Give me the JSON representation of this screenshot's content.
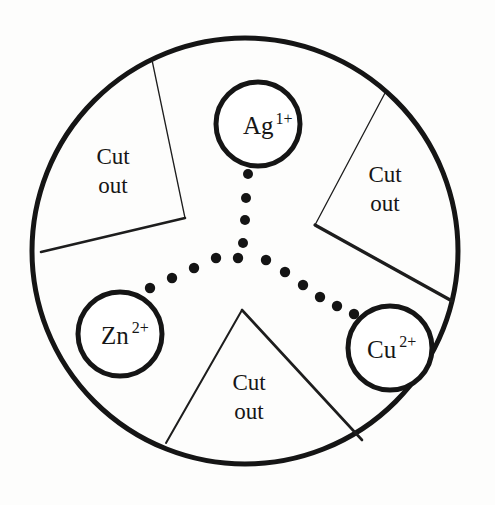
{
  "figure": {
    "background_color": "#fdfdfc",
    "outer_circle": {
      "name": "outer-disc",
      "cx": 245,
      "cy": 251,
      "r": 213,
      "stroke_color": "#151515",
      "stroke_width": 5
    },
    "ions": [
      {
        "id": "ag",
        "symbol": "Ag",
        "charge": "1+",
        "label": "Ag 1+",
        "cx": 258,
        "cy": 124,
        "r": 42,
        "text_x": 243,
        "text_y": 134,
        "sup_dx": 2,
        "sup_dy": -10,
        "stroke_color": "#151515",
        "stroke_width": 5
      },
      {
        "id": "zn",
        "symbol": "Zn",
        "charge": "2+",
        "label": "Zn 2+",
        "cx": 120,
        "cy": 334,
        "r": 42,
        "text_x": 101,
        "text_y": 344,
        "sup_dx": 3,
        "sup_dy": -11,
        "stroke_color": "#151515",
        "stroke_width": 5
      },
      {
        "id": "cu",
        "symbol": "Cu",
        "charge": "2+",
        "label": "Cu 2+",
        "cx": 390,
        "cy": 348,
        "r": 42,
        "text_x": 367,
        "text_y": 358,
        "sup_dx": 3,
        "sup_dy": -11,
        "stroke_color": "#151515",
        "stroke_width": 5
      }
    ],
    "cutouts": [
      {
        "id": "cutout-top-left",
        "line1": "Cut",
        "line2": "out",
        "text_x": 113,
        "text_y1": 164,
        "text_y2": 193,
        "points": "152,60 185,218 41,252",
        "stroke_color": "#1d1d1d",
        "stroke_width_thin": 1.3,
        "stroke_width_thick": 2.6
      },
      {
        "id": "cutout-right",
        "line1": "Cut",
        "line2": "out",
        "text_x": 385,
        "text_y1": 182,
        "text_y2": 211,
        "points": "385,93 315,225 452,301",
        "stroke_color": "#1d1d1d",
        "stroke_width_thin": 1.3,
        "stroke_width_thick": 3.2
      },
      {
        "id": "cutout-bottom",
        "line1": "Cut",
        "line2": "out",
        "text_x": 249,
        "text_y1": 390,
        "text_y2": 419,
        "points": "166,443 242,310 362,440",
        "stroke_color": "#1d1d1d",
        "stroke_width_thin": 2.0,
        "stroke_width_thick": 2.6
      }
    ],
    "dot_arms": [
      {
        "id": "dot-arm-top",
        "toward": "Ag",
        "dots": [
          {
            "cx": 248,
            "cy": 174,
            "r": 5.0
          },
          {
            "cx": 246,
            "cy": 198,
            "r": 5.0
          },
          {
            "cx": 245,
            "cy": 220,
            "r": 5.0
          },
          {
            "cx": 243,
            "cy": 243,
            "r": 5.0
          },
          {
            "cx": 238,
            "cy": 258,
            "r": 5.2
          }
        ]
      },
      {
        "id": "dot-arm-left",
        "toward": "Zn",
        "dots": [
          {
            "cx": 216,
            "cy": 258,
            "r": 5.2
          },
          {
            "cx": 214,
            "cy": 259,
            "r": 0.1
          },
          {
            "cx": 213,
            "cy": 259,
            "r": 0.1
          },
          {
            "cx": 212,
            "cy": 259,
            "r": 0.1
          },
          {
            "cx": 212,
            "cy": 259,
            "r": 0.1
          },
          {
            "cx": 213,
            "cy": 260,
            "r": 0.1
          },
          {
            "cx": 214,
            "cy": 260,
            "r": 0.1
          },
          {
            "cx": 215,
            "cy": 261,
            "r": 0.1
          },
          {
            "cx": 213,
            "cy": 258,
            "r": 0.1
          },
          {
            "cx": 214,
            "cy": 259,
            "r": 0.1
          },
          {
            "cx": 213,
            "cy": 260,
            "r": 0.1
          },
          {
            "cx": 214,
            "cy": 259,
            "r": 0.1
          },
          {
            "cx": 212,
            "cy": 260,
            "r": 0.1
          },
          {
            "cx": 215,
            "cy": 259,
            "r": 0.1
          },
          {
            "cx": 213,
            "cy": 259,
            "r": 0.1
          },
          {
            "cx": 213,
            "cy": 260,
            "r": 0.1
          },
          {
            "cx": 214,
            "cy": 260,
            "r": 0.1
          },
          {
            "cx": 213,
            "cy": 259,
            "r": 0.1
          },
          {
            "cx": 214,
            "cy": 259,
            "r": 0.1
          },
          {
            "cx": 213,
            "cy": 259,
            "r": 0.1
          },
          {
            "cx": 214,
            "cy": 260,
            "r": 0.1
          },
          {
            "cx": 213,
            "cy": 259,
            "r": 0.1
          },
          {
            "cx": 212,
            "cy": 260,
            "r": 0.1
          },
          {
            "cx": 213,
            "cy": 259,
            "r": 0.1
          },
          {
            "cx": 214,
            "cy": 259,
            "r": 0.1
          },
          {
            "cx": 213,
            "cy": 260,
            "r": 0.1
          },
          {
            "cx": 214,
            "cy": 259,
            "r": 0.1
          },
          {
            "cx": 213,
            "cy": 259,
            "r": 0.1
          },
          {
            "cx": 195,
            "cy": 258,
            "r": 0.1
          },
          {
            "cx": 214,
            "cy": 260,
            "r": 0.1
          },
          {
            "cx": 213,
            "cy": 259,
            "r": 0.1
          },
          {
            "cx": 214,
            "cy": 259,
            "r": 0.1
          },
          {
            "cx": 213,
            "cy": 260,
            "r": 0.1
          },
          {
            "cx": 214,
            "cy": 259,
            "r": 0.1
          },
          {
            "cx": 213,
            "cy": 259,
            "r": 0.1
          },
          {
            "cx": 213,
            "cy": 260,
            "r": 0.1
          },
          {
            "cx": 214,
            "cy": 259,
            "r": 0.1
          },
          {
            "cx": 213,
            "cy": 259,
            "r": 0.1
          },
          {
            "cx": 214,
            "cy": 260,
            "r": 0.1
          },
          {
            "cx": 213,
            "cy": 259,
            "r": 0.1
          },
          {
            "cx": 214,
            "cy": 259,
            "r": 0.1
          },
          {
            "cx": 213,
            "cy": 260,
            "r": 0.1
          },
          {
            "cx": 212,
            "cy": 259,
            "r": 0.1
          },
          {
            "cx": 213,
            "cy": 259,
            "r": 0.1
          },
          {
            "cx": 214,
            "cy": 260,
            "r": 0.1
          },
          {
            "cx": 213,
            "cy": 259,
            "r": 0.1
          },
          {
            "cx": 214,
            "cy": 259,
            "r": 0.1
          },
          {
            "cx": 213,
            "cy": 259,
            "r": 0.1
          },
          {
            "cx": 214,
            "cy": 260,
            "r": 0.1
          },
          {
            "cx": 213,
            "cy": 259,
            "r": 0.1
          },
          {
            "cx": 213,
            "cy": 259,
            "r": 0.1
          },
          {
            "cx": 214,
            "cy": 259,
            "r": 0.1
          },
          {
            "cx": 213,
            "cy": 260,
            "r": 0.1
          },
          {
            "cx": 214,
            "cy": 259,
            "r": 0.1
          },
          {
            "cx": 213,
            "cy": 259,
            "r": 0.1
          },
          {
            "cx": 214,
            "cy": 259,
            "r": 0.1
          },
          {
            "cx": 213,
            "cy": 260,
            "r": 0.1
          },
          {
            "cx": 214,
            "cy": 259,
            "r": 0.1
          },
          {
            "cx": 213,
            "cy": 259,
            "r": 0.1
          },
          {
            "cx": 214,
            "cy": 260,
            "r": 0.1
          },
          {
            "cx": 213,
            "cy": 259,
            "r": 0.1
          },
          {
            "cx": 214,
            "cy": 259,
            "r": 0.1
          },
          {
            "cx": 213,
            "cy": 260,
            "r": 0.1
          },
          {
            "cx": 214,
            "cy": 259,
            "r": 0.1
          },
          {
            "cx": 213,
            "cy": 259,
            "r": 0.1
          },
          {
            "cx": 214,
            "cy": 259,
            "r": 0.1
          },
          {
            "cx": 213,
            "cy": 260,
            "r": 0.1
          },
          {
            "cx": 214,
            "cy": 259,
            "r": 0.1
          }
        ]
      },
      {
        "id": "dot-arm-right",
        "toward": "Cu",
        "dots": []
      }
    ],
    "dot_arm_left_simple": [
      {
        "cx": 216,
        "cy": 258,
        "r": 5.2
      },
      {
        "cx": 194,
        "cy": 268,
        "r": 5.2
      },
      {
        "cx": 172,
        "cy": 278,
        "r": 5.2
      },
      {
        "cx": 150,
        "cy": 288,
        "r": 5.2
      },
      {
        "cx": 128,
        "cy": 298,
        "r": 5.2
      }
    ],
    "dot_arm_right_simple": [
      {
        "cx": 266,
        "cy": 260,
        "r": 5.2
      },
      {
        "cx": 285,
        "cy": 272,
        "r": 5.2
      },
      {
        "cx": 303,
        "cy": 285,
        "r": 5.2
      },
      {
        "cx": 320,
        "cy": 297,
        "r": 5.2
      },
      {
        "cx": 337,
        "cy": 306,
        "r": 5.2
      },
      {
        "cx": 354,
        "cy": 314,
        "r": 5.2
      }
    ],
    "dot_color": "#141414"
  },
  "legend": {
    "cut_out_label": "Cut out",
    "ion_labels": [
      "Ag 1+",
      "Zn 2+",
      "Cu 2+"
    ]
  }
}
